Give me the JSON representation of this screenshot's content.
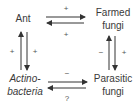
{
  "diagram": {
    "nodes": {
      "ant": {
        "label": "Ant"
      },
      "farmed_fungi": {
        "line1": "Farmed",
        "line2": "fungi"
      },
      "actinobacteria": {
        "line1": "Actino-",
        "line2": "bacteria"
      },
      "parasitic_fungi": {
        "line1": "Parasitic",
        "line2": "fungi"
      }
    },
    "edges": {
      "ant_to_farmed": {
        "sign": "+"
      },
      "farmed_to_ant": {
        "sign": "+"
      },
      "ant_to_actino": {
        "sign": "+"
      },
      "actino_to_ant": {
        "sign": "+"
      },
      "farmed_to_parasitic": {
        "sign": "+"
      },
      "parasitic_to_farmed": {
        "sign": "−"
      },
      "actino_to_parasitic": {
        "sign": "−"
      },
      "parasitic_to_actino": {
        "sign": "?"
      }
    },
    "colors": {
      "text": "#3a3a3a",
      "arrow": "#333333",
      "background": "#ffffff"
    }
  }
}
